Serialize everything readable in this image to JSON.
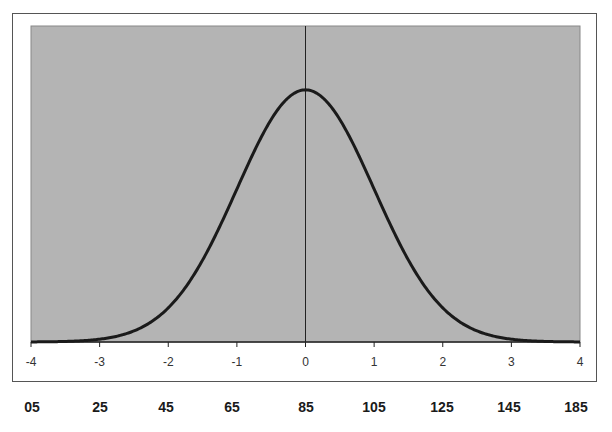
{
  "chart_data": {
    "type": "line",
    "title": "",
    "xlabel": "",
    "ylabel": "",
    "x_axis_ticks": [
      "-4",
      "-3",
      "-2",
      "-1",
      "0",
      "1",
      "2",
      "3",
      "4"
    ],
    "secondary_x_labels": [
      "05",
      "25",
      "45",
      "65",
      "85",
      "105",
      "125",
      "145",
      "185"
    ],
    "xlim": [
      -4,
      4
    ],
    "ylim": [
      0,
      0.45
    ],
    "grid": false,
    "legend": null,
    "vertical_reference_line_at": 0,
    "series": [
      {
        "name": "normal density",
        "x": [
          -4,
          -3.5,
          -3,
          -2.5,
          -2,
          -1.5,
          -1,
          -0.5,
          0,
          0.5,
          1,
          1.5,
          2,
          2.5,
          3,
          3.5,
          4
        ],
        "values": [
          0.0001,
          0.0009,
          0.0044,
          0.0175,
          0.054,
          0.1295,
          0.242,
          0.3521,
          0.3989,
          0.3521,
          0.242,
          0.1295,
          0.054,
          0.0175,
          0.0044,
          0.0009,
          0.0001
        ]
      }
    ],
    "colors": {
      "plot_background": "#b4b4b4",
      "curve": "#1a1a1a",
      "axis": "#222222"
    }
  }
}
